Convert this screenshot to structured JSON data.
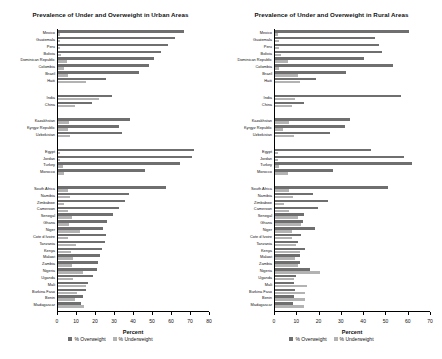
{
  "figure": {
    "legend": {
      "overweight": "% Overweight",
      "underweight": "% Underweight"
    },
    "colors": {
      "overweight": "#6f6f6f",
      "underweight": "#b3b3b3"
    }
  },
  "chart_data": [
    {
      "type": "bar",
      "orientation": "horizontal",
      "title": "Prevalence of Under and Overweight in Urban Areas",
      "xlabel": "Percent",
      "ylabel": "",
      "xlim": [
        0,
        80
      ],
      "xticks": [
        0,
        10,
        20,
        30,
        40,
        50,
        60,
        70,
        80
      ],
      "grid": false,
      "legend_position": "bottom",
      "legend_entries": [
        "% Overweight",
        "% Underweight"
      ],
      "series": [
        {
          "name": "% Overweight",
          "color": "#6f6f6f"
        },
        {
          "name": "% Underweight",
          "color": "#b3b3b3"
        }
      ],
      "groups": [
        {
          "name": "Latin America and Caribbean",
          "categories": [
            "Mexico",
            "Guatemala",
            "Peru",
            "Bolivia",
            "Dominican Republic",
            "Colombia",
            "Brazil",
            "Haiti"
          ],
          "overweight": [
            66.5,
            61.5,
            58.0,
            54.0,
            50.5,
            48.0,
            42.5,
            25.5
          ],
          "underweight": [
            0.9,
            1.0,
            1.2,
            1.6,
            4.5,
            3.0,
            5.0,
            14.5
          ]
        },
        {
          "name": "Asia",
          "categories": [
            "India",
            "China"
          ],
          "overweight": [
            28.5,
            18.0
          ],
          "underweight": [
            21.5,
            9.0
          ]
        },
        {
          "name": "Central Asia",
          "categories": [
            "Kazakhstan",
            "Kyrgyz Republic",
            "Uzbekistan"
          ],
          "overweight": [
            38.0,
            32.0,
            33.5
          ],
          "underweight": [
            6.0,
            5.5,
            6.5
          ]
        },
        {
          "name": "North Africa and Middle East",
          "categories": [
            "Egypt",
            "Jordan",
            "Turkey",
            "Morocco"
          ],
          "overweight": [
            71.5,
            70.5,
            64.0,
            46.0
          ],
          "underweight": [
            1.0,
            1.2,
            2.5,
            3.0
          ]
        },
        {
          "name": "Sub-Saharan Africa",
          "categories": [
            "South Africa",
            "Namibia",
            "Zimbabwe",
            "Cameroon",
            "Senegal",
            "Ghana",
            "Niger",
            "Cote d Ivoire",
            "Tanzania",
            "Kenya",
            "Malawi",
            "Zambia",
            "Nigeria",
            "Uganda",
            "Mali",
            "Burkina Faso",
            "Benin",
            "Madagascar"
          ],
          "overweight": [
            57.0,
            37.5,
            35.0,
            32.0,
            29.0,
            26.0,
            23.5,
            25.0,
            24.5,
            23.0,
            22.0,
            21.0,
            20.5,
            18.5,
            16.0,
            14.5,
            13.0,
            12.0
          ],
          "underweight": [
            5.5,
            6.5,
            3.0,
            5.0,
            7.5,
            6.0,
            11.5,
            5.5,
            9.5,
            7.0,
            8.0,
            7.5,
            13.0,
            8.0,
            14.5,
            10.0,
            9.0,
            13.5
          ]
        }
      ]
    },
    {
      "type": "bar",
      "orientation": "horizontal",
      "title": "Prevalence of Under and Overweight in Rural Areas",
      "xlabel": "Percent",
      "ylabel": "",
      "xlim": [
        0,
        70
      ],
      "xticks": [
        0,
        10,
        20,
        30,
        40,
        50,
        60,
        70
      ],
      "grid": false,
      "legend_position": "bottom",
      "legend_entries": [
        "% Overweight",
        "% Underweight"
      ],
      "series": [
        {
          "name": "% Overweight",
          "color": "#6f6f6f"
        },
        {
          "name": "% Underweight",
          "color": "#b3b3b3"
        }
      ],
      "groups": [
        {
          "name": "Latin America and Caribbean",
          "categories": [
            "Mexico",
            "Guatemala",
            "Peru",
            "Bolivia",
            "Dominican Republic",
            "Colombia",
            "Brazil",
            "Haiti"
          ],
          "overweight": [
            60.0,
            45.0,
            46.5,
            48.0,
            40.0,
            53.0,
            32.0,
            18.5
          ],
          "underweight": [
            1.5,
            2.0,
            1.8,
            2.5,
            6.0,
            2.0,
            10.5,
            11.0
          ]
        },
        {
          "name": "Asia",
          "categories": [
            "India",
            "China"
          ],
          "overweight": [
            56.5,
            13.0
          ],
          "underweight": [
            9.0,
            7.5
          ]
        },
        {
          "name": "Central Asia",
          "categories": [
            "Kazakhstan",
            "Kyrgyz Republic",
            "Uzbekistan"
          ],
          "overweight": [
            33.5,
            31.5,
            24.5
          ],
          "underweight": [
            6.5,
            3.5,
            8.5
          ]
        },
        {
          "name": "North Africa and Middle East",
          "categories": [
            "Egypt",
            "Jordan",
            "Turkey",
            "Morocco"
          ],
          "overweight": [
            43.0,
            58.0,
            61.5,
            26.0
          ],
          "underweight": [
            1.5,
            1.5,
            2.0,
            6.0
          ]
        },
        {
          "name": "Sub-Saharan Africa",
          "categories": [
            "South Africa",
            "Namibia",
            "Zimbabwe",
            "Cameroon",
            "Senegal",
            "Ghana",
            "Niger",
            "Cote d Ivoire",
            "Tanzania",
            "Kenya",
            "Malawi",
            "Zambia",
            "Nigeria",
            "Uganda",
            "Mali",
            "Burkina Faso",
            "Benin",
            "Madagascar"
          ],
          "overweight": [
            50.5,
            17.0,
            24.0,
            19.5,
            13.0,
            12.5,
            18.0,
            11.5,
            10.5,
            13.5,
            11.0,
            11.0,
            15.5,
            9.5,
            8.5,
            9.0,
            8.5,
            8.0
          ],
          "underweight": [
            6.5,
            8.0,
            4.0,
            6.5,
            10.5,
            11.5,
            7.5,
            7.5,
            9.5,
            11.0,
            9.0,
            10.5,
            20.0,
            8.5,
            14.5,
            13.5,
            13.5,
            13.0
          ]
        }
      ]
    }
  ]
}
